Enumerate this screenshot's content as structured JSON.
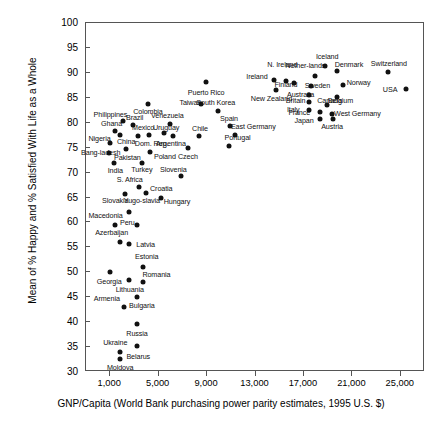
{
  "chart_data": {
    "type": "scatter",
    "title": "",
    "xlabel": "GNP/Capita (World Bank purchasing power parity estimates, 1995 U.S. $)",
    "ylabel": "Mean of % Happy and % Satisfied With Life as a Whole",
    "xlim": [
      -1000,
      27000
    ],
    "ylim": [
      30,
      100
    ],
    "xticks": [
      1000,
      5000,
      9000,
      13000,
      17000,
      21000,
      25000
    ],
    "xticklabels": [
      "1,000",
      "5,000",
      "9,000",
      "13,000",
      "17,000",
      "21,000",
      "25,000"
    ],
    "yticks": [
      30,
      35,
      40,
      45,
      50,
      55,
      60,
      65,
      70,
      75,
      80,
      85,
      90,
      95,
      100
    ],
    "yticklabels": [
      "30",
      "35",
      "40",
      "45",
      "50",
      "55",
      "60",
      "65",
      "70",
      "75",
      "80",
      "85",
      "90",
      "95",
      "100"
    ],
    "grid": false,
    "legend": "none",
    "marker_color": "#111111",
    "points": [
      {
        "name": "Moldova",
        "x": 1900,
        "y": 32.5,
        "lx": 1900,
        "ly": 30.6,
        "pos": "below"
      },
      {
        "name": "Belarus",
        "x": 1900,
        "y": 33.8,
        "lx": 3400,
        "ly": 32.8,
        "pos": "right"
      },
      {
        "name": "Ukraine",
        "x": 3300,
        "y": 35.1,
        "lx": 1500,
        "ly": 35.6,
        "pos": "left"
      },
      {
        "name": "Russia",
        "x": 3300,
        "y": 39.4,
        "lx": 3300,
        "ly": 37.5,
        "pos": "below"
      },
      {
        "name": "Armenia",
        "x": 2200,
        "y": 42.9,
        "lx": 800,
        "ly": 44.4,
        "pos": "left"
      },
      {
        "name": "Bulgaria",
        "x": 3300,
        "y": 44.9,
        "lx": 3700,
        "ly": 43.0,
        "pos": "below"
      },
      {
        "name": "Georgia",
        "x": 1100,
        "y": 49.9,
        "lx": 1000,
        "ly": 47.9,
        "pos": "below"
      },
      {
        "name": "Lithuania",
        "x": 2600,
        "y": 48.2,
        "lx": 2700,
        "ly": 46.3,
        "pos": "below"
      },
      {
        "name": "Romania",
        "x": 3800,
        "y": 47.8,
        "lx": 4900,
        "ly": 49.3,
        "pos": "above"
      },
      {
        "name": "Estonia",
        "x": 3800,
        "y": 50.8,
        "lx": 4100,
        "ly": 52.8,
        "pos": "above"
      },
      {
        "name": "Latvia",
        "x": 2600,
        "y": 55.4,
        "lx": 4000,
        "ly": 55.3,
        "pos": "right"
      },
      {
        "name": "Azerbaijan",
        "x": 1900,
        "y": 55.8,
        "lx": 1200,
        "ly": 57.6,
        "pos": "above"
      },
      {
        "name": "Peru",
        "x": 3300,
        "y": 59.3,
        "lx": 2500,
        "ly": 59.6,
        "pos": "left"
      },
      {
        "name": "Macedonia",
        "x": 1500,
        "y": 59.2,
        "lx": 700,
        "ly": 61.0,
        "pos": "above"
      },
      {
        "name": "Yugo-slavia",
        "x": 2600,
        "y": 61.9,
        "lx": 3700,
        "ly": 64.1,
        "pos": "above"
      },
      {
        "name": "Slovakia",
        "x": 2300,
        "y": 65.5,
        "lx": 1500,
        "ly": 64.0,
        "pos": "below"
      },
      {
        "name": "Hungary",
        "x": 5300,
        "y": 64.6,
        "lx": 6600,
        "ly": 63.8,
        "pos": "right"
      },
      {
        "name": "Croatia",
        "x": 4000,
        "y": 65.7,
        "lx": 5300,
        "ly": 66.5,
        "pos": "right"
      },
      {
        "name": "S. Africa",
        "x": 3500,
        "y": 67.0,
        "lx": 2700,
        "ly": 68.3,
        "pos": "left"
      },
      {
        "name": "Slovenia",
        "x": 6900,
        "y": 69.1,
        "lx": 6300,
        "ly": 70.4,
        "pos": "above"
      },
      {
        "name": "Turkey",
        "x": 3700,
        "y": 71.8,
        "lx": 3700,
        "ly": 70.3,
        "pos": "below"
      },
      {
        "name": "India",
        "x": 1400,
        "y": 71.8,
        "lx": 1500,
        "ly": 70.1,
        "pos": "below"
      },
      {
        "name": "Bang-ladesh",
        "x": 1000,
        "y": 73.7,
        "lx": 300,
        "ly": 73.8,
        "pos": "left"
      },
      {
        "name": "Poland",
        "x": 4400,
        "y": 73.9,
        "lx": 5600,
        "ly": 73.0,
        "pos": "right"
      },
      {
        "name": "Czech",
        "x": 7500,
        "y": 74.7,
        "lx": 7500,
        "ly": 73.0,
        "pos": "below"
      },
      {
        "name": "Pakistan",
        "x": 2400,
        "y": 74.5,
        "lx": 2500,
        "ly": 72.8,
        "pos": "below"
      },
      {
        "name": "Portugal",
        "x": 10900,
        "y": 75.2,
        "lx": 11600,
        "ly": 76.7,
        "pos": "above"
      },
      {
        "name": "Nigeria",
        "x": 1100,
        "y": 75.7,
        "lx": 200,
        "ly": 76.5,
        "pos": "left"
      },
      {
        "name": "Dom. Rep.",
        "x": 4300,
        "y": 77.4,
        "lx": 4500,
        "ly": 75.6,
        "pos": "below"
      },
      {
        "name": "Argentina",
        "x": 6300,
        "y": 77.1,
        "lx": 6100,
        "ly": 75.6,
        "pos": "below"
      },
      {
        "name": "Chile",
        "x": 8400,
        "y": 77.2,
        "lx": 8500,
        "ly": 78.6,
        "pos": "above"
      },
      {
        "name": "China",
        "x": 1900,
        "y": 77.3,
        "lx": 2400,
        "ly": 76.0,
        "pos": "below"
      },
      {
        "name": "Mexico",
        "x": 3400,
        "y": 77.2,
        "lx": 3800,
        "ly": 78.7,
        "pos": "above"
      },
      {
        "name": "Uruguay",
        "x": 5500,
        "y": 77.8,
        "lx": 5700,
        "ly": 78.8,
        "pos": "above"
      },
      {
        "name": "East Germany",
        "x": 11400,
        "y": 77.4,
        "lx": 12900,
        "ly": 79.0,
        "pos": "right"
      },
      {
        "name": "Spain",
        "x": 11000,
        "y": 79.1,
        "lx": 10900,
        "ly": 80.5,
        "pos": "above"
      },
      {
        "name": "Ghana",
        "x": 1500,
        "y": 78.2,
        "lx": 1200,
        "ly": 79.6,
        "pos": "above"
      },
      {
        "name": "Brazil",
        "x": 3000,
        "y": 79.3,
        "lx": 3100,
        "ly": 80.7,
        "pos": "above"
      },
      {
        "name": "Venezuela",
        "x": 6000,
        "y": 79.5,
        "lx": 5800,
        "ly": 81.1,
        "pos": "above"
      },
      {
        "name": "Philippines",
        "x": 2100,
        "y": 80.1,
        "lx": 1100,
        "ly": 81.4,
        "pos": "above"
      },
      {
        "name": "Japan",
        "x": 18400,
        "y": 80.5,
        "lx": 17100,
        "ly": 80.2,
        "pos": "left"
      },
      {
        "name": "Austria",
        "x": 19500,
        "y": 80.5,
        "lx": 19400,
        "ly": 78.9,
        "pos": "below"
      },
      {
        "name": "West Germany",
        "x": 19400,
        "y": 81.6,
        "lx": 21500,
        "ly": 81.6,
        "pos": "right"
      },
      {
        "name": "France",
        "x": 18400,
        "y": 81.9,
        "lx": 16700,
        "ly": 81.7,
        "pos": "left"
      },
      {
        "name": "Italy",
        "x": 17500,
        "y": 82.4,
        "lx": 16200,
        "ly": 82.4,
        "pos": "left"
      },
      {
        "name": "Canada",
        "x": 19000,
        "y": 83.3,
        "lx": 19200,
        "ly": 84.2,
        "pos": "above"
      },
      {
        "name": "Colombia",
        "x": 4200,
        "y": 83.6,
        "lx": 4200,
        "ly": 81.9,
        "pos": "below"
      },
      {
        "name": "South Korea",
        "x": 10000,
        "y": 82.2,
        "lx": 9800,
        "ly": 83.7,
        "pos": "above"
      },
      {
        "name": "Taiwan",
        "x": 8600,
        "y": 83.6,
        "lx": 7700,
        "ly": 83.7,
        "pos": "left"
      },
      {
        "name": "Britain",
        "x": 17500,
        "y": 84.0,
        "lx": 16400,
        "ly": 84.2,
        "pos": "left"
      },
      {
        "name": "Belgium",
        "x": 19800,
        "y": 85.0,
        "lx": 20100,
        "ly": 84.2,
        "pos": "right"
      },
      {
        "name": "Australia",
        "x": 17500,
        "y": 85.3,
        "lx": 16800,
        "ly": 85.4,
        "pos": "left"
      },
      {
        "name": "USA",
        "x": 25500,
        "y": 86.5,
        "lx": 24200,
        "ly": 86.3,
        "pos": "left"
      },
      {
        "name": "Puerto Rico",
        "x": 9000,
        "y": 88.0,
        "lx": 9000,
        "ly": 85.8,
        "pos": "below"
      },
      {
        "name": "New Zealand",
        "x": 14800,
        "y": 86.3,
        "lx": 14400,
        "ly": 84.6,
        "pos": "below"
      },
      {
        "name": "Sweden",
        "x": 17700,
        "y": 87.2,
        "lx": 18200,
        "ly": 87.2,
        "pos": "right"
      },
      {
        "name": "Norway",
        "x": 20300,
        "y": 87.3,
        "lx": 21600,
        "ly": 87.8,
        "pos": "right"
      },
      {
        "name": "Finland",
        "x": 16300,
        "y": 87.8,
        "lx": 15600,
        "ly": 87.3,
        "pos": "left"
      },
      {
        "name": "Ireland",
        "x": 14600,
        "y": 88.4,
        "lx": 13200,
        "ly": 89.0,
        "pos": "left"
      },
      {
        "name": "N. Ireland",
        "x": 15600,
        "y": 88.2,
        "lx": 15300,
        "ly": 91.3,
        "pos": "above"
      },
      {
        "name": "Nether-lands",
        "x": 18000,
        "y": 89.2,
        "lx": 17200,
        "ly": 91.1,
        "pos": "above"
      },
      {
        "name": "Switzerland",
        "x": 24000,
        "y": 89.9,
        "lx": 24100,
        "ly": 91.6,
        "pos": "above"
      },
      {
        "name": "Denmark",
        "x": 19800,
        "y": 90.2,
        "lx": 20800,
        "ly": 91.3,
        "pos": "right"
      },
      {
        "name": "Iceland",
        "x": 18800,
        "y": 91.1,
        "lx": 19000,
        "ly": 92.9,
        "pos": "above"
      }
    ]
  }
}
